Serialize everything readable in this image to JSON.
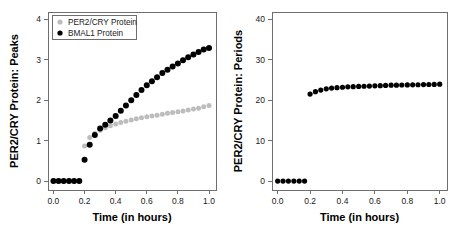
{
  "figure": {
    "background": "#ffffff",
    "panel_count": 2
  },
  "chart_data": [
    {
      "panel": "left",
      "type": "scatter",
      "title": "",
      "xlabel": "Time (in hours)",
      "ylabel": "PER2/CRY Protein: Peaks",
      "xlim": [
        -0.035,
        1.045
      ],
      "ylim": [
        -0.22,
        4.18
      ],
      "xticks": [
        0.0,
        0.2,
        0.4,
        0.6,
        0.8,
        1.0
      ],
      "xticklabels": [
        "0.0",
        "0.2",
        "0.4",
        "0.6",
        "0.8",
        "1.0"
      ],
      "yticks": [
        0,
        1,
        2,
        3,
        4
      ],
      "yticklabels": [
        "0",
        "1",
        "2",
        "3",
        "4"
      ],
      "grid": false,
      "legend_position": "top-left",
      "series": [
        {
          "name": "PER2/CRY Protein",
          "color": "#bdbdbd",
          "marker": "circle",
          "marker_size": 2.5,
          "x": [
            0.0,
            0.033,
            0.066,
            0.1,
            0.133,
            0.166,
            0.2,
            0.233,
            0.266,
            0.3,
            0.333,
            0.366,
            0.4,
            0.433,
            0.466,
            0.5,
            0.533,
            0.566,
            0.6,
            0.633,
            0.666,
            0.7,
            0.733,
            0.766,
            0.8,
            0.833,
            0.866,
            0.9,
            0.933,
            0.966,
            1.0
          ],
          "y": [
            0.0,
            0.0,
            0.0,
            0.0,
            0.0,
            0.0,
            0.87,
            1.08,
            1.18,
            1.26,
            1.32,
            1.37,
            1.41,
            1.45,
            1.48,
            1.51,
            1.54,
            1.565,
            1.59,
            1.61,
            1.63,
            1.655,
            1.675,
            1.695,
            1.715,
            1.735,
            1.755,
            1.78,
            1.8,
            1.84,
            1.87
          ]
        },
        {
          "name": "BMAL1 Protein",
          "color": "#000000",
          "marker": "circle",
          "marker_size": 3.0,
          "x": [
            0.0,
            0.033,
            0.066,
            0.1,
            0.133,
            0.166,
            0.2,
            0.233,
            0.266,
            0.3,
            0.333,
            0.366,
            0.4,
            0.433,
            0.466,
            0.5,
            0.533,
            0.566,
            0.6,
            0.633,
            0.666,
            0.7,
            0.733,
            0.766,
            0.8,
            0.833,
            0.866,
            0.9,
            0.933,
            0.966,
            1.0
          ],
          "y": [
            0.0,
            0.0,
            0.0,
            0.0,
            0.0,
            0.0,
            0.53,
            0.9,
            1.14,
            1.3,
            1.39,
            1.5,
            1.61,
            1.74,
            1.87,
            2.0,
            2.13,
            2.25,
            2.37,
            2.47,
            2.57,
            2.67,
            2.75,
            2.83,
            2.91,
            2.99,
            3.06,
            3.13,
            3.19,
            3.25,
            3.29
          ]
        }
      ],
      "legend": [
        {
          "label": "PER2/CRY Protein",
          "color": "#bdbdbd",
          "marker": "circle"
        },
        {
          "label": "BMAL1 Protein",
          "color": "#000000",
          "marker": "circle"
        }
      ]
    },
    {
      "panel": "right",
      "type": "scatter",
      "title": "",
      "xlabel": "Time (in hours)",
      "ylabel": "PER2/CRY Protein: Periods",
      "xlim": [
        -0.035,
        1.045
      ],
      "ylim": [
        -2.2,
        41.8
      ],
      "xticks": [
        0.0,
        0.2,
        0.4,
        0.6,
        0.8,
        1.0
      ],
      "xticklabels": [
        "0.0",
        "0.2",
        "0.4",
        "0.6",
        "0.8",
        "1.0"
      ],
      "yticks": [
        0,
        10,
        20,
        30,
        40
      ],
      "yticklabels": [
        "0",
        "10",
        "20",
        "30",
        "40"
      ],
      "grid": false,
      "legend_position": "none",
      "series": [
        {
          "name": "PER2/CRY Protein: Periods",
          "color": "#000000",
          "marker": "circle",
          "marker_size": 2.6,
          "x": [
            0.0,
            0.033,
            0.066,
            0.1,
            0.133,
            0.166,
            0.2,
            0.233,
            0.266,
            0.3,
            0.333,
            0.366,
            0.4,
            0.433,
            0.466,
            0.5,
            0.533,
            0.566,
            0.6,
            0.633,
            0.666,
            0.7,
            0.733,
            0.766,
            0.8,
            0.833,
            0.866,
            0.9,
            0.933,
            0.966,
            1.0
          ],
          "y": [
            0.0,
            0.0,
            0.0,
            0.0,
            0.0,
            0.0,
            21.5,
            22.1,
            22.5,
            22.8,
            23.0,
            23.1,
            23.2,
            23.3,
            23.35,
            23.4,
            23.45,
            23.5,
            23.55,
            23.6,
            23.65,
            23.7,
            23.72,
            23.75,
            23.78,
            23.8,
            23.82,
            23.85,
            23.88,
            23.9,
            23.95
          ]
        }
      ],
      "legend": []
    }
  ]
}
